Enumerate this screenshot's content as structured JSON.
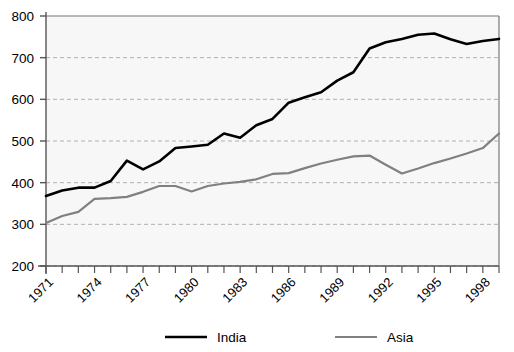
{
  "chart_data": {
    "type": "line",
    "title": "",
    "xlabel": "",
    "ylabel": "",
    "xlim": [
      1971,
      1999
    ],
    "ylim": [
      200,
      800
    ],
    "ytick_values": [
      200,
      300,
      400,
      500,
      600,
      700,
      800
    ],
    "ytick_labels": [
      "200",
      "300",
      "400",
      "500",
      "600",
      "700",
      "800"
    ],
    "grid": "horizontal-dashed",
    "legend_position": "bottom-center",
    "x": [
      1971,
      1972,
      1973,
      1974,
      1975,
      1976,
      1977,
      1978,
      1979,
      1980,
      1981,
      1982,
      1983,
      1984,
      1985,
      1986,
      1987,
      1988,
      1989,
      1990,
      1991,
      1992,
      1993,
      1994,
      1995,
      1996,
      1997,
      1998,
      1999
    ],
    "xtick_values": [
      1971,
      1972,
      1973,
      1974,
      1975,
      1976,
      1977,
      1978,
      1979,
      1980,
      1981,
      1982,
      1983,
      1984,
      1985,
      1986,
      1987,
      1988,
      1989,
      1990,
      1991,
      1992,
      1993,
      1994,
      1995,
      1996,
      1997,
      1998,
      1999
    ],
    "xtick_labels": [
      "1971",
      "",
      "",
      "1974",
      "",
      "",
      "1977",
      "",
      "",
      "1980",
      "",
      "",
      "1983",
      "",
      "",
      "1986",
      "",
      "",
      "1989",
      "",
      "",
      "1992",
      "",
      "",
      "1995",
      "",
      "",
      "1998",
      ""
    ],
    "series": [
      {
        "name": "India",
        "color": "#000000",
        "values": [
          368,
          381,
          388,
          388,
          404,
          453,
          432,
          451,
          483,
          487,
          491,
          518,
          508,
          538,
          553,
          592,
          605,
          617,
          645,
          665,
          722,
          737,
          745,
          755,
          758,
          744,
          733,
          740,
          745
        ]
      },
      {
        "name": "Asia",
        "color": "#808080",
        "values": [
          303,
          320,
          330,
          361,
          363,
          366,
          378,
          392,
          392,
          379,
          392,
          398,
          402,
          408,
          421,
          423,
          435,
          446,
          455,
          463,
          465,
          443,
          422,
          434,
          447,
          458,
          470,
          483,
          518
        ]
      }
    ]
  },
  "legend": {
    "items": [
      {
        "label": "India",
        "color": "#000000"
      },
      {
        "label": "Asia",
        "color": "#808080"
      }
    ]
  },
  "plot_area": {
    "background": "#f7f7f7",
    "gridline_color": "#b0b0b0",
    "axis_color": "#555555"
  }
}
